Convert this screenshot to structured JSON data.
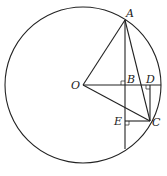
{
  "diagram": {
    "type": "geometry",
    "circle": {
      "center": "O",
      "cx": 83,
      "cy": 85,
      "r": 78
    },
    "points": {
      "O": {
        "label": "O",
        "x": 83,
        "y": 85
      },
      "A": {
        "label": "A",
        "x": 125,
        "y": 20
      },
      "B": {
        "label": "B",
        "x": 125,
        "y": 85
      },
      "D": {
        "label": "D",
        "x": 150,
        "y": 85
      },
      "C": {
        "label": "C",
        "x": 150,
        "y": 121
      },
      "E": {
        "label": "E",
        "x": 125,
        "y": 121
      }
    },
    "segments": [
      "OA",
      "OC",
      "AC",
      "OD-extended-to-circle",
      "AB-extended-to-circle",
      "DC",
      "EC"
    ],
    "right_angles": [
      "B",
      "D",
      "E"
    ]
  }
}
